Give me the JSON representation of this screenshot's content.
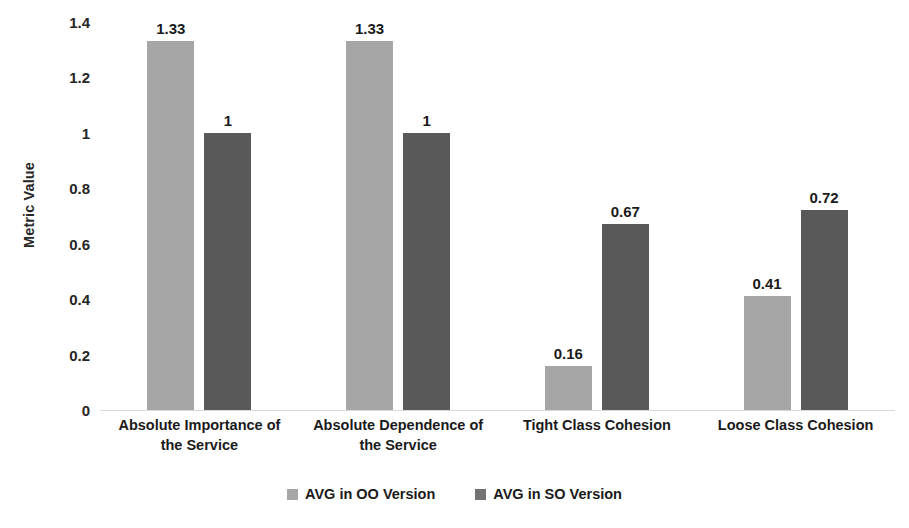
{
  "chart_data": {
    "type": "bar",
    "title": "",
    "xlabel": "",
    "ylabel": "Metric Value",
    "ylim": [
      0,
      1.4
    ],
    "yticks": [
      "0",
      "0.2",
      "0.4",
      "0.6",
      "0.8",
      "1",
      "1.2",
      "1.4"
    ],
    "ytick_values": [
      0,
      0.2,
      0.4,
      0.6,
      0.8,
      1,
      1.2,
      1.4
    ],
    "grid": false,
    "legend_position": "bottom",
    "categories": [
      "Absolute Importance of the Service",
      "Absolute Dependence of the Service",
      "Tight Class Cohesion",
      "Loose Class Cohesion"
    ],
    "category_lines": [
      [
        "Absolute Importance of",
        "the Service"
      ],
      [
        "Absolute Dependence of",
        "the Service"
      ],
      [
        "Tight Class Cohesion"
      ],
      [
        "Loose Class Cohesion"
      ]
    ],
    "series": [
      {
        "name": "AVG in OO Version",
        "color": "#a6a6a6",
        "values": [
          1.33,
          1.33,
          0.16,
          0.41
        ],
        "labels": [
          "1.33",
          "1.33",
          "0.16",
          "0.41"
        ]
      },
      {
        "name": "AVG in SO Version",
        "color": "#595959",
        "values": [
          1,
          1,
          0.67,
          0.72
        ],
        "labels": [
          "1",
          "1",
          "0.67",
          "0.72"
        ]
      }
    ]
  },
  "axis": {
    "y_title": "Metric Value",
    "ticks": [
      {
        "label": "1.4",
        "value": 1.4
      },
      {
        "label": "1.2",
        "value": 1.2
      },
      {
        "label": "1",
        "value": 1.0
      },
      {
        "label": "0.8",
        "value": 0.8
      },
      {
        "label": "0.6",
        "value": 0.6
      },
      {
        "label": "0.4",
        "value": 0.4
      },
      {
        "label": "0.2",
        "value": 0.2
      },
      {
        "label": "0",
        "value": 0.0
      }
    ]
  },
  "groups": [
    {
      "line1": "Absolute Importance of",
      "line2": "the Service",
      "oo_label": "1.33",
      "so_label": "1"
    },
    {
      "line1": "Absolute Dependence of",
      "line2": "the Service",
      "oo_label": "1.33",
      "so_label": "1"
    },
    {
      "line1": "Tight Class Cohesion",
      "line2": "",
      "oo_label": "0.16",
      "so_label": "0.67"
    },
    {
      "line1": "Loose Class Cohesion",
      "line2": "",
      "oo_label": "0.41",
      "so_label": "0.72"
    }
  ],
  "legend": {
    "items": [
      {
        "label": "AVG in OO Version",
        "color": "#a6a6a6"
      },
      {
        "label": "AVG in SO Version",
        "color": "#737373"
      }
    ]
  },
  "colors": {
    "oo_bar": "#a6a6a6",
    "so_bar": "#595959",
    "axis_line": "#d9d9d9",
    "text": "#1a1a1a",
    "background": "#ffffff"
  }
}
